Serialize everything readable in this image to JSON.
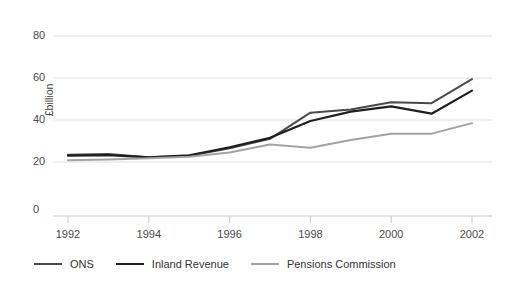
{
  "chart_data": {
    "type": "line",
    "title": "",
    "subtitle": "",
    "xlabel": "",
    "ylabel": "£billion",
    "x": [
      1992,
      1993,
      1994,
      1995,
      1996,
      1997,
      1998,
      1999,
      2000,
      2001,
      2002
    ],
    "xlim": [
      1992,
      2002
    ],
    "ylim": [
      0,
      80
    ],
    "xticks": [
      "1992",
      "1994",
      "1996",
      "1998",
      "2000",
      "2002"
    ],
    "xtick_values": [
      1992,
      1994,
      1996,
      1998,
      2000,
      2002
    ],
    "yticks": [
      "0",
      "20",
      "40",
      "60",
      "80"
    ],
    "ytick_values": [
      0,
      20,
      40,
      60,
      80
    ],
    "grid": "horizontal",
    "legend_position": "bottom",
    "axis_break": true,
    "series": [
      {
        "name": "ONS",
        "color": "#4a4a4a",
        "width": 2.0,
        "values": [
          23.5,
          23.8,
          22.3,
          23.0,
          26.5,
          31.0,
          43.5,
          45.0,
          48.5,
          48.0,
          59.5
        ]
      },
      {
        "name": "Inland Revenue",
        "color": "#1f1f1f",
        "width": 2.2,
        "values": [
          23.0,
          23.3,
          22.2,
          23.2,
          27.0,
          31.5,
          39.5,
          44.0,
          46.5,
          43.0,
          54.0
        ]
      },
      {
        "name": "Pensions Commission",
        "color": "#a3a3a3",
        "width": 2.0,
        "values": [
          20.8,
          21.2,
          21.8,
          22.5,
          24.5,
          28.3,
          26.8,
          30.5,
          33.5,
          33.5,
          38.5
        ]
      }
    ]
  },
  "legend": {
    "items": [
      {
        "label": "ONS",
        "color": "#4a4a4a"
      },
      {
        "label": "Inland Revenue",
        "color": "#1f1f1f"
      },
      {
        "label": "Pensions Commission",
        "color": "#a3a3a3"
      }
    ]
  },
  "style": {
    "background": "#ffffff",
    "grid_color": "#e2e2e2",
    "axis_color": "#c9c9c9",
    "text_color": "#4a4a4a"
  }
}
